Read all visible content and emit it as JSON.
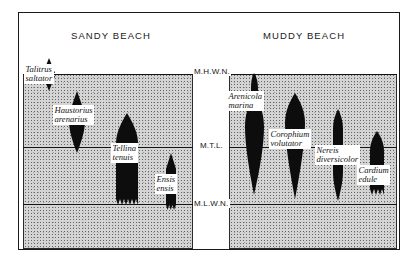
{
  "figure": {
    "panels": [
      {
        "id": "sandy",
        "title": "SANDY BEACH"
      },
      {
        "id": "muddy",
        "title": "MUDDY BEACH"
      }
    ],
    "tide_levels": [
      {
        "id": "mhwn",
        "label": "M.H.W.N."
      },
      {
        "id": "mtl",
        "label": "M.T.L."
      },
      {
        "id": "mlwn",
        "label": "M.L.W.N."
      }
    ],
    "species": [
      {
        "id": "talitrus",
        "panel": "sandy",
        "name_line1": "Talitrus",
        "name_line2": "saltator"
      },
      {
        "id": "haustorius",
        "panel": "sandy",
        "name_line1": "Haustorius",
        "name_line2": "arenarius"
      },
      {
        "id": "tellina",
        "panel": "sandy",
        "name_line1": "Tellina",
        "name_line2": "tenuis"
      },
      {
        "id": "ensis",
        "panel": "sandy",
        "name_line1": "Ensis",
        "name_line2": "ensis"
      },
      {
        "id": "arenicola",
        "panel": "muddy",
        "name_line1": "Arenicola",
        "name_line2": "marina"
      },
      {
        "id": "corophium",
        "panel": "muddy",
        "name_line1": "Corophium",
        "name_line2": "volutator"
      },
      {
        "id": "nereis",
        "panel": "muddy",
        "name_line1": "Nereis",
        "name_line2": "diversicolor"
      },
      {
        "id": "cardium",
        "panel": "muddy",
        "name_line1": "Cardium",
        "name_line2": "edule"
      }
    ],
    "colors": {
      "ink": "#141414",
      "species_fill": "#0d0d0d",
      "substrate": "#d2d2d2",
      "background": "#ffffff"
    }
  }
}
